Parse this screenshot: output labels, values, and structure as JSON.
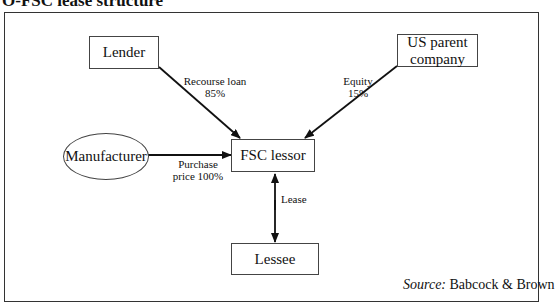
{
  "title": "O-FSC lease structure",
  "nodes": {
    "lender": "Lender",
    "us_parent_line1": "US parent",
    "us_parent_line2": "company",
    "manufacturer": "Manufacturer",
    "fsc_lessor": "FSC lessor",
    "lessee": "Lessee"
  },
  "edges": {
    "lender_to_fsc_line1": "Recourse loan",
    "lender_to_fsc_line2": "85%",
    "parent_to_fsc_line1": "Equity",
    "parent_to_fsc_line2": "15%",
    "manufacturer_to_fsc_line1": "Purchase",
    "manufacturer_to_fsc_line2": "price 100%",
    "fsc_lessee": "Lease"
  },
  "source": {
    "prefix": "Source:",
    "text": " Babcock & Brown"
  }
}
